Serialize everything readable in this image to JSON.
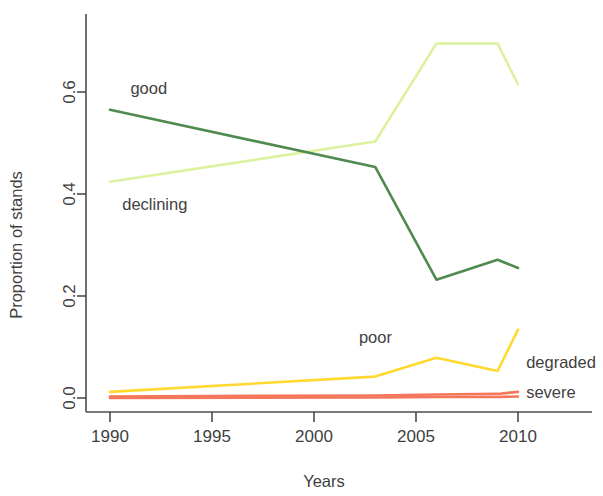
{
  "chart_data": {
    "type": "line",
    "title": "",
    "xlabel": "Years",
    "ylabel": "Proportion of stands",
    "xlim": [
      1989,
      2011.5
    ],
    "ylim": [
      -0.02,
      0.74
    ],
    "grid": false,
    "legend_position": "inline-labels",
    "x_ticks": [
      "1990",
      "1995",
      "2000",
      "2005",
      "2010"
    ],
    "x_tick_values": [
      1990,
      1995,
      2000,
      2005,
      2010
    ],
    "y_ticks": [
      "0.0",
      "0.2",
      "0.4",
      "0.6"
    ],
    "y_tick_values": [
      0.0,
      0.2,
      0.4,
      0.6
    ],
    "x": [
      1990,
      2003,
      2006,
      2009,
      2010
    ],
    "series": [
      {
        "name": "declining",
        "color": "#ddf2a0",
        "values": [
          0.424,
          0.503,
          0.695,
          0.695,
          0.615
        ],
        "label_x": 1990.6,
        "label_y": 0.368
      },
      {
        "name": "good",
        "color": "#4f8a4f",
        "values": [
          0.565,
          0.453,
          0.232,
          0.271,
          0.255
        ],
        "label_x": 1991.0,
        "label_y": 0.597
      },
      {
        "name": "poor",
        "color": "#ffd92e",
        "values": [
          0.012,
          0.042,
          0.079,
          0.053,
          0.134
        ],
        "label_x": 2002.2,
        "label_y": 0.107
      },
      {
        "name": "degraded",
        "color": "#f4775b",
        "values": [
          0.003,
          0.005,
          0.007,
          0.008,
          0.012
        ],
        "label_x": 2010.4,
        "label_y": 0.058
      },
      {
        "name": "severe",
        "color": "#f4775b",
        "values": [
          0.0,
          0.001,
          0.002,
          0.002,
          0.003
        ],
        "label_x": 2010.4,
        "label_y": 0.0
      }
    ],
    "inline_labels": [
      {
        "text": "good",
        "series": "good"
      },
      {
        "text": "declining",
        "series": "declining"
      },
      {
        "text": "poor",
        "series": "poor"
      },
      {
        "text": "degraded",
        "series": "degraded"
      },
      {
        "text": "severe",
        "series": "severe"
      }
    ]
  }
}
